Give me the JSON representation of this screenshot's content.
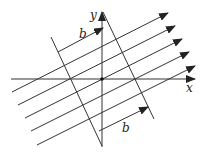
{
  "labels": {
    "x_axis": "x",
    "y_axis": "y",
    "b_top": "b",
    "b_bottom": "b"
  },
  "colors": {
    "stroke": "#333333",
    "background": "#ffffff"
  },
  "geometry": {
    "origin": [
      102,
      79
    ],
    "x_axis": {
      "from": [
        11,
        79
      ],
      "to": [
        195,
        79
      ]
    },
    "y_axis": {
      "from": [
        102,
        147
      ],
      "to": [
        102,
        12
      ]
    },
    "left_slanted_line": {
      "from": [
        51,
        37
      ],
      "to": [
        102,
        146
      ]
    },
    "right_slanted_line": {
      "from": [
        103,
        12
      ],
      "to": [
        154,
        119
      ]
    },
    "parallel_arrows": [
      {
        "from": [
          12,
          92
        ],
        "to": [
          168,
          13
        ]
      },
      {
        "from": [
          18,
          105
        ],
        "to": [
          175,
          26
        ]
      },
      {
        "from": [
          25,
          118
        ],
        "to": [
          182,
          39
        ]
      },
      {
        "from": [
          31,
          131
        ],
        "to": [
          189,
          52
        ]
      },
      {
        "from": [
          37,
          145
        ],
        "to": [
          195,
          66
        ]
      }
    ],
    "b_arrow_top": {
      "from": [
        58,
        52
      ],
      "to": [
        103,
        28
      ]
    },
    "b_arrow_bottom": {
      "from": [
        99,
        131
      ],
      "to": [
        148,
        107
      ]
    }
  }
}
